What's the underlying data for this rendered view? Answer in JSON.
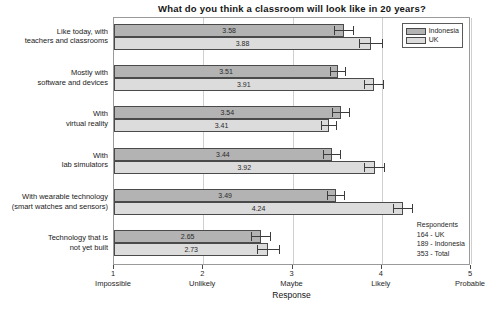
{
  "chart_data": {
    "type": "bar",
    "orientation": "horizontal",
    "title": "What do you think a classroom will look like in 20 years?",
    "xlabel": "Response",
    "ylabel": "",
    "xlim": [
      1,
      5
    ],
    "grid": true,
    "legend_position": "top-right",
    "categories": [
      "Like today, with\nteachers and classrooms",
      "Mostly with\nsoftware and devices",
      "With\nvirtual reality",
      "With\nlab simulators",
      "With wearable technology\n(smart watches and sensors)",
      "Technology that is\nnot yet built"
    ],
    "category_lines": [
      [
        "Like today, with",
        "teachers and classrooms"
      ],
      [
        "Mostly with",
        "software and devices"
      ],
      [
        "With",
        "virtual reality"
      ],
      [
        "With",
        "lab simulators"
      ],
      [
        "With wearable technology",
        "(smart watches and sensors)"
      ],
      [
        "Technology that is",
        "not yet built"
      ]
    ],
    "series": [
      {
        "name": "Indonesia",
        "color": "#b3b3b3",
        "values": [
          3.58,
          3.51,
          3.54,
          3.44,
          3.49,
          2.65
        ],
        "value_labels": [
          "3.58",
          "3.51",
          "3.54",
          "3.44",
          "3.49",
          "2.65"
        ],
        "errors": [
          0.11,
          0.09,
          0.1,
          0.1,
          0.1,
          0.11
        ]
      },
      {
        "name": "UK",
        "color": "#dcdcdc",
        "values": [
          3.88,
          3.91,
          3.41,
          3.92,
          4.24,
          2.73
        ],
        "value_labels": [
          "3.88",
          "3.91",
          "3.41",
          "3.92",
          "4.24",
          "2.73"
        ],
        "errors": [
          0.13,
          0.11,
          0.09,
          0.12,
          0.11,
          0.13
        ]
      }
    ],
    "xticks": [
      1,
      2,
      3,
      4,
      5
    ],
    "xtick_numbers": [
      "1",
      "2",
      "3",
      "4",
      "5"
    ],
    "xtick_words": [
      "Impossible",
      "Unlikely",
      "Maybe",
      "Likely",
      "Probable"
    ]
  },
  "legend": {
    "items": [
      {
        "label": "Indonesia"
      },
      {
        "label": "UK"
      }
    ]
  },
  "respondents": {
    "heading": "Respondents",
    "lines": [
      "164 - UK",
      "189 - Indonesia",
      "353 - Total"
    ]
  }
}
